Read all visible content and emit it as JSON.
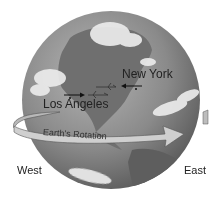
{
  "diagram": {
    "type": "illustration",
    "colors": {
      "background": "#ffffff",
      "ocean": "#8f8f8f",
      "land": "#6e6e6e",
      "clouds": "#e8e8e8",
      "arrow_band": "#c8c8c8",
      "text": "#222222"
    },
    "labels": {
      "city_east": "New York",
      "city_west": "Los Angeles",
      "rotation": "Earth's Rotation",
      "direction_left": "West",
      "direction_right": "East"
    },
    "flight_arrows": [
      {
        "from": "Los Angeles",
        "direction": "east",
        "icon": "airplane-icon"
      },
      {
        "from": "New York",
        "direction": "west",
        "icon": "airplane-icon"
      }
    ],
    "rotation_arrow": {
      "direction": "west-to-east"
    }
  }
}
